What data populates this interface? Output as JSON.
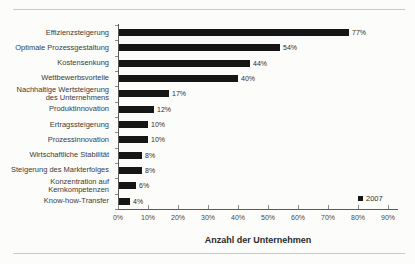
{
  "chart_data": {
    "type": "bar",
    "orientation": "horizontal",
    "categories": [
      "Effizienzsteigerung",
      "Optimale Prozessgestaltung",
      "Kostensenkung",
      "Wettbewerbsvorteile",
      "Nachhaltige Wertsteigerung\ndes Unternehmens",
      "Produktinnovation",
      "Ertragssteigerung",
      "Prozessinnovation",
      "Wirtschaftliche Stabilität",
      "Steigerung des Markterfolges",
      "Konzentration auf\nKernkompetenzen",
      "Know-how-Transfer"
    ],
    "values": [
      77,
      54,
      44,
      40,
      17,
      12,
      10,
      10,
      8,
      8,
      6,
      4
    ],
    "value_labels": [
      "77%",
      "54%",
      "44%",
      "40%",
      "17%",
      "12%",
      "10%",
      "10%",
      "8%",
      "8%",
      "6%",
      "4%"
    ],
    "title": "",
    "xlabel": "Anzahl der Unternehmen",
    "ylabel": "",
    "xlim": [
      0,
      90
    ],
    "xticks": [
      "0%",
      "10%",
      "20%",
      "30%",
      "40%",
      "50%",
      "60%",
      "70%",
      "80%",
      "90%"
    ],
    "grid": false,
    "legend_position": "bottom-right",
    "legend": [
      {
        "label": "2007",
        "color": "#161616"
      }
    ],
    "bar_color": "#161616"
  }
}
